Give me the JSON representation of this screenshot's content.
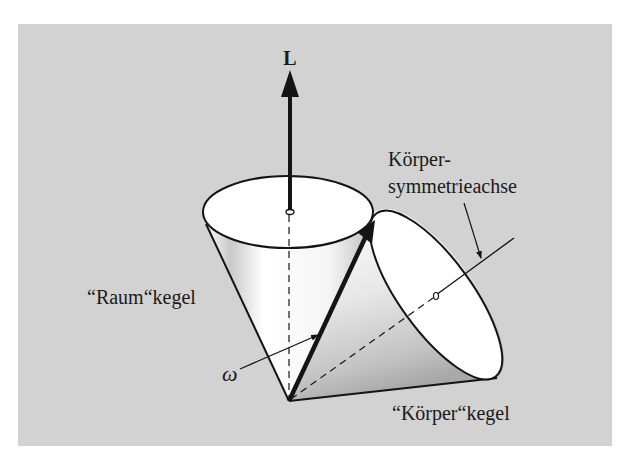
{
  "figure": {
    "background_color": "#d2d2d2",
    "panel": {
      "x": 18,
      "y": 24,
      "width": 594,
      "height": 422
    },
    "labels": {
      "angular_momentum": "L",
      "body_axis_line1": "Körper-",
      "body_axis_line2": "symmetrieachse",
      "space_cone": "“Raum“kegel",
      "angular_velocity": "ω",
      "body_cone": "“Körper“kegel"
    },
    "colors": {
      "panel": "#d2d2d2",
      "cone_fill": "#ffffff",
      "cone_shade": "#b8b8b8",
      "ink": "#141414"
    }
  }
}
